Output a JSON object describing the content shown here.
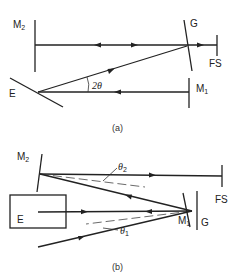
{
  "figure": {
    "panel_a": {
      "caption": "(a)",
      "labels": {
        "m2": "M",
        "m2_sub": "2",
        "g": "G",
        "fs": "FS",
        "e": "E",
        "m1": "M",
        "m1_sub": "1",
        "angle": "2θ"
      }
    },
    "panel_b": {
      "caption": "(b)",
      "labels": {
        "m2": "M",
        "m2_sub": "2",
        "fs": "FS",
        "e": "E",
        "m1": "M",
        "m1_sub": "1",
        "g": "G",
        "theta2": "θ",
        "theta2_sub": "2",
        "theta1": "θ",
        "theta1_sub": "1"
      }
    }
  }
}
